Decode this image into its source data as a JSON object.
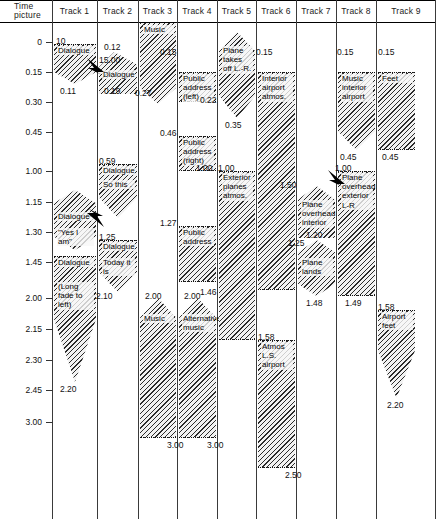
{
  "chart_data": {
    "type": "table",
    "axis": {
      "label_line1": "Time",
      "label_line2": "picture",
      "ticks": [
        "0",
        "0.15",
        "0.30",
        "0.45",
        "1.00",
        "1.15",
        "1.30",
        "1.45",
        "2.00",
        "2.15",
        "2.30",
        "2.45",
        "3.00"
      ],
      "tick_y": [
        42,
        72,
        102,
        132,
        171,
        202,
        232,
        262,
        298,
        329,
        360,
        390,
        422
      ]
    },
    "columns": [
      {
        "name": "Time picture"
      },
      {
        "name": "Track 1"
      },
      {
        "name": "Track 2"
      },
      {
        "name": "Track 3"
      },
      {
        "name": "Track 4"
      },
      {
        "name": "Track 5"
      },
      {
        "name": "Track 6"
      },
      {
        "name": "Track 7"
      },
      {
        "name": "Track 8"
      },
      {
        "name": "Track 9"
      }
    ],
    "clips": [
      {
        "track": 1,
        "label": "Dialogue",
        "sub": "",
        "start": "10",
        "end": "0.11",
        "top": 44,
        "bottom": 84,
        "shape": "flat-top-vee"
      },
      {
        "track": 2,
        "label": "Dialogue",
        "sub": "",
        "start": "0.12",
        "end": "0.19",
        "top": 58,
        "bottom": 94,
        "shape": "peak-top-vee",
        "marker": "15.00"
      },
      {
        "track": 3,
        "label": "Music",
        "sub": "",
        "start": "",
        "end": "0.27",
        "top": 22,
        "bottom": 104,
        "shape": "flat-top-vee"
      },
      {
        "track": 4,
        "label": "Public address (left)",
        "sub": "",
        "start": "0.15",
        "end": "0.22",
        "top": 72,
        "bottom": 102,
        "shape": "flat"
      },
      {
        "track": 4,
        "label": "Public address (right)",
        "sub": "",
        "start": "0.46",
        "end": "1.00",
        "top": 136,
        "bottom": 171,
        "shape": "flat"
      },
      {
        "track": 4,
        "label": "Public address",
        "sub": "",
        "start": "1.27",
        "end": "1.46",
        "top": 226,
        "bottom": 282,
        "shape": "flat"
      },
      {
        "track": 4,
        "label": "Alternative music",
        "sub": "",
        "start": "2.00",
        "end": "3.00",
        "top": 298,
        "bottom": 438,
        "shape": "peak-top-flat"
      },
      {
        "track": 3,
        "label": "Music",
        "sub": "",
        "start": "2.10",
        "end": "3.00",
        "top": 298,
        "bottom": 438,
        "shape": "peak-top-flat"
      },
      {
        "track": 5,
        "label": "Plane takes off L.-R.",
        "sub": "",
        "start": "",
        "end": "0.35",
        "top": 32,
        "bottom": 118,
        "shape": "peak-top-vee"
      },
      {
        "track": 5,
        "label": "Exterior planes atmos.",
        "sub": "",
        "start": "1.00",
        "end": "1.58",
        "top": 171,
        "bottom": 340,
        "shape": "flat"
      },
      {
        "track": 6,
        "label": "Interior airport atmos.",
        "sub": "",
        "start": "0.15",
        "end": "1.50",
        "top": 72,
        "bottom": 290,
        "shape": "flat"
      },
      {
        "track": 6,
        "label": "Atmos L.S. airport",
        "sub": "",
        "start": "1.58",
        "end": "2.50",
        "top": 340,
        "bottom": 468,
        "shape": "flat"
      },
      {
        "track": 7,
        "label": "Plane overhead interior",
        "sub": "",
        "start": "1.50",
        "end": "1.20",
        "top": 186,
        "bottom": 238,
        "shape": "peak-top-vee"
      },
      {
        "track": 7,
        "label": "Plane lands",
        "sub": "",
        "start": "1.25",
        "end": "1.48",
        "top": 240,
        "bottom": 296,
        "shape": "peak-top-vee"
      },
      {
        "track": 8,
        "label": "Music interior airport",
        "sub": "",
        "start": "0.15",
        "end": "0.45",
        "top": 72,
        "bottom": 150,
        "shape": "flat-top-vee"
      },
      {
        "track": 8,
        "label": "Plane overhead exterior L-R",
        "sub": "",
        "start": "1.00",
        "end": "1.49",
        "top": 171,
        "bottom": 296,
        "shape": "flat"
      },
      {
        "track": 9,
        "label": "Feet",
        "sub": "",
        "start": "0.15",
        "end": "0.45",
        "top": 72,
        "bottom": 150,
        "shape": "flat"
      },
      {
        "track": 9,
        "label": "Airport feet",
        "sub": "",
        "start": "1.58",
        "end": "2.20",
        "top": 310,
        "bottom": 398,
        "shape": "flat-top-vee"
      },
      {
        "track": 1,
        "label": "Dialogue",
        "sub": "\"Yes I am\"",
        "start": "",
        "end": "1.25",
        "top": 190,
        "bottom": 250,
        "shape": "peak-top-vee"
      },
      {
        "track": 2,
        "label": "Dialogue",
        "sub": "So this .",
        "start": "0.59",
        "end": "",
        "top": 164,
        "bottom": 218,
        "shape": "flat-top-vee"
      },
      {
        "track": 2,
        "label": "Dialogue",
        "sub": "Today it is",
        "start": "1.25",
        "end": "",
        "top": 240,
        "bottom": 292,
        "shape": "flat-top-vee"
      },
      {
        "track": 1,
        "label": "Dialogue",
        "sub": "(Long fade to left)",
        "start": "",
        "end": "2.20",
        "top": 256,
        "bottom": 382,
        "shape": "flat-top-vee"
      }
    ],
    "numbers": [
      {
        "text": "10",
        "x": 56,
        "y": 36
      },
      {
        "text": "0.11",
        "x": 60,
        "y": 86
      },
      {
        "text": "0.12",
        "x": 104,
        "y": 42
      },
      {
        "text": "15.00",
        "x": 99,
        "y": 55
      },
      {
        "text": "0.19",
        "x": 104,
        "y": 86
      },
      {
        "text": "0.27",
        "x": 135,
        "y": 88
      },
      {
        "text": "0.15",
        "x": 160,
        "y": 47
      },
      {
        "text": "0.22",
        "x": 200,
        "y": 95
      },
      {
        "text": "0.46",
        "x": 160,
        "y": 128
      },
      {
        "text": "1.00",
        "x": 196,
        "y": 163
      },
      {
        "text": "1.27",
        "x": 160,
        "y": 218
      },
      {
        "text": "1.46",
        "x": 200,
        "y": 287
      },
      {
        "text": "2.00",
        "x": 145,
        "y": 291
      },
      {
        "text": "2.00",
        "x": 184,
        "y": 291
      },
      {
        "text": "2.10",
        "x": 96,
        "y": 291
      },
      {
        "text": "3.00",
        "x": 167,
        "y": 440
      },
      {
        "text": "3.00",
        "x": 207,
        "y": 440
      },
      {
        "text": "0.35",
        "x": 225,
        "y": 120
      },
      {
        "text": "1.00",
        "x": 218,
        "y": 163
      },
      {
        "text": "1.58",
        "x": 258,
        "y": 332
      },
      {
        "text": "0.15",
        "x": 256,
        "y": 47
      },
      {
        "text": "1.50",
        "x": 280,
        "y": 180
      },
      {
        "text": "2.50",
        "x": 285,
        "y": 470
      },
      {
        "text": "1.20",
        "x": 306,
        "y": 230
      },
      {
        "text": "1.25",
        "x": 288,
        "y": 238
      },
      {
        "text": "1.48",
        "x": 306,
        "y": 298
      },
      {
        "text": "0.15",
        "x": 337,
        "y": 47
      },
      {
        "text": "0.45",
        "x": 340,
        "y": 152
      },
      {
        "text": "1.00",
        "x": 335,
        "y": 163
      },
      {
        "text": "1.49",
        "x": 345,
        "y": 298
      },
      {
        "text": "0.15",
        "x": 378,
        "y": 47
      },
      {
        "text": "0.45",
        "x": 382,
        "y": 152
      },
      {
        "text": "1.58",
        "x": 378,
        "y": 302
      },
      {
        "text": "2.20",
        "x": 387,
        "y": 400
      },
      {
        "text": "0.59",
        "x": 99,
        "y": 156
      },
      {
        "text": "1.25",
        "x": 99,
        "y": 232
      },
      {
        "text": "2.20",
        "x": 60,
        "y": 384
      }
    ]
  },
  "header": {
    "time_line1": "Time",
    "time_line2": "picture",
    "tracks": [
      "Track 1",
      "Track 2",
      "Track 3",
      "Track 4",
      "Track 5",
      "Track 6",
      "Track 7",
      "Track 8",
      "Track 9"
    ]
  },
  "clip_labels": {
    "t1_dialogue_1": "Dialogue",
    "t1_dialogue_2": "Dialogue",
    "t1_yesiam": "\"Yes I am\"",
    "t1_dialogue_3": "Dialogue",
    "t1_longfade": "(Long fade to left)",
    "t2_dialogue_1": "Dialogue",
    "t2_dialogue_2": "Dialogue",
    "t2_sothis": "So this .",
    "t2_dialogue_3": "Dialogue",
    "t2_today": "Today it is",
    "t3_music_1": "Music",
    "t3_music_2": "Music",
    "t4_pa_left": "Public address (left)",
    "t4_pa_right": "Public address (right)",
    "t4_pa": "Public address",
    "t4_altmusic": "Alternative music",
    "t5_planetakesoff": "Plane takes off L.-R.",
    "t5_extplanes": "Exterior planes atmos.",
    "t6_intairport": "Interior airport atmos.",
    "t6_atmosls": "Atmos L.S. airport",
    "t7_planeoverhead": "Plane overhead interior",
    "t7_planelands": "Plane lands",
    "t8_musicint": "Music interior airport",
    "t8_planeoverext": "Plane overhead exterior L-R",
    "t9_feet": "Feet",
    "t9_airportfeet": "Airport feet"
  },
  "colors": {
    "ink": "#111111",
    "hatch": "#2b2b2b",
    "paper": "#ffffff",
    "fill": "#f2f2f2"
  }
}
